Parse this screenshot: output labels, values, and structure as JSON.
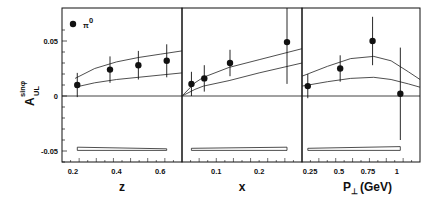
{
  "chart_data": {
    "type": "scatter",
    "ylabel": "A_UL^sinφ",
    "ylabel_main": "A",
    "ylabel_sup": "sinφ",
    "ylabel_sub": "UL",
    "ylim": [
      -0.06,
      0.065
    ],
    "yticks": [
      "0.05",
      "0",
      "-0.05"
    ],
    "legend": {
      "marker": "filled-circle",
      "label": "π",
      "label_sup": "0",
      "position": "top-left"
    },
    "panels": [
      {
        "xlabel": "z",
        "xticks": [
          "0.2",
          "0.4",
          "0.6"
        ],
        "xlim": [
          0.15,
          0.7
        ],
        "points": [
          {
            "x": 0.22,
            "y": 0.01,
            "err": 0.011
          },
          {
            "x": 0.37,
            "y": 0.024,
            "err": 0.012
          },
          {
            "x": 0.5,
            "y": 0.028,
            "err": 0.013
          },
          {
            "x": 0.63,
            "y": 0.032,
            "err": 0.015
          }
        ],
        "curves": [
          {
            "name": "upper",
            "x": [
              0.21,
              0.3,
              0.4,
              0.5,
              0.6,
              0.7
            ],
            "y": [
              0.016,
              0.025,
              0.031,
              0.035,
              0.038,
              0.041
            ]
          },
          {
            "name": "lower",
            "x": [
              0.21,
              0.3,
              0.4,
              0.5,
              0.6,
              0.7
            ],
            "y": [
              0.008,
              0.012,
              0.015,
              0.017,
              0.019,
              0.021
            ]
          }
        ],
        "syst_band": {
          "x": [
            0.22,
            0.63
          ],
          "y_top": [
            -0.0465,
            -0.048
          ],
          "y_bottom": [
            -0.0495,
            -0.0495
          ]
        }
      },
      {
        "xlabel": "x",
        "xticks": [
          "0.1",
          "0.2"
        ],
        "xlim": [
          0.02,
          0.3
        ],
        "points": [
          {
            "x": 0.042,
            "y": 0.011,
            "err": 0.011
          },
          {
            "x": 0.072,
            "y": 0.016,
            "err": 0.012
          },
          {
            "x": 0.132,
            "y": 0.03,
            "err": 0.012
          },
          {
            "x": 0.265,
            "y": 0.049,
            "err": 0.038
          }
        ],
        "curves": [
          {
            "name": "upper",
            "x": [
              0.02,
              0.05,
              0.07,
              0.13,
              0.2,
              0.3
            ],
            "y": [
              0.0,
              0.012,
              0.017,
              0.026,
              0.033,
              0.043
            ]
          },
          {
            "name": "lower",
            "x": [
              0.02,
              0.05,
              0.07,
              0.13,
              0.2,
              0.3
            ],
            "y": [
              0.0,
              0.006,
              0.009,
              0.014,
              0.021,
              0.03
            ]
          }
        ],
        "syst_band": {
          "x": [
            0.042,
            0.265
          ],
          "y_top": [
            -0.0475,
            -0.0465
          ],
          "y_bottom": [
            -0.0495,
            -0.0495
          ]
        }
      },
      {
        "xlabel": "P⊥ (GeV)",
        "xlabel_main": "P",
        "xlabel_sub": "⊥",
        "xlabel_unit": "(GeV)",
        "xticks": [
          "0.25",
          "0.5",
          "0.75",
          "1"
        ],
        "xlim": [
          0.18,
          1.2
        ],
        "points": [
          {
            "x": 0.23,
            "y": 0.009,
            "err": 0.011
          },
          {
            "x": 0.51,
            "y": 0.025,
            "err": 0.012
          },
          {
            "x": 0.79,
            "y": 0.05,
            "err": 0.022
          },
          {
            "x": 1.03,
            "y": 0.002,
            "err": 0.042
          }
        ],
        "curves": [
          {
            "name": "upper",
            "x": [
              0.18,
              0.4,
              0.6,
              0.8,
              0.95,
              1.1,
              1.2
            ],
            "y": [
              0.018,
              0.027,
              0.034,
              0.036,
              0.032,
              0.022,
              0.015
            ]
          },
          {
            "name": "lower",
            "x": [
              0.18,
              0.4,
              0.6,
              0.8,
              0.95,
              1.1,
              1.2
            ],
            "y": [
              0.009,
              0.013,
              0.016,
              0.017,
              0.015,
              0.011,
              0.008
            ]
          }
        ],
        "syst_band": {
          "x": [
            0.23,
            1.03
          ],
          "y_top": [
            -0.0475,
            -0.046
          ],
          "y_bottom": [
            -0.0495,
            -0.0495
          ]
        }
      }
    ]
  }
}
